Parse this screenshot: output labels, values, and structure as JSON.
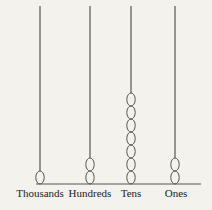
{
  "diagram": {
    "type": "abacus",
    "background": "#f4f2ec",
    "line_color": "#555555",
    "rods": [
      {
        "label": "Thousands",
        "beads": 1,
        "x": 40
      },
      {
        "label": "Hundreds",
        "beads": 2,
        "x": 90
      },
      {
        "label": "Tens",
        "beads": 7,
        "x": 131
      },
      {
        "label": "Ones",
        "beads": 2,
        "x": 175
      }
    ]
  }
}
